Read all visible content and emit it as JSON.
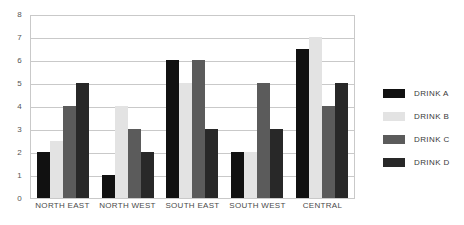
{
  "chart_data": {
    "type": "bar",
    "title": "",
    "xlabel": "",
    "ylabel": "",
    "ylim": [
      0,
      8
    ],
    "y_ticks": [
      0,
      1,
      2,
      3,
      4,
      5,
      6,
      7,
      8
    ],
    "grid": true,
    "legend_position": "right",
    "categories": [
      "NORTH EAST",
      "NORTH WEST",
      "SOUTH EAST",
      "SOUTH WEST",
      "CENTRAL"
    ],
    "series": [
      {
        "name": "DRINK A",
        "color": "#111111",
        "values": [
          2,
          1,
          6,
          2,
          6.5
        ]
      },
      {
        "name": "DRINK B",
        "color": "#e3e3e3",
        "values": [
          2.5,
          4,
          5,
          2,
          7
        ]
      },
      {
        "name": "DRINK C",
        "color": "#5b5b5b",
        "values": [
          4,
          3,
          6,
          5,
          4
        ]
      },
      {
        "name": "DRINK D",
        "color": "#282828",
        "values": [
          5,
          2,
          3,
          3,
          5
        ]
      }
    ]
  }
}
